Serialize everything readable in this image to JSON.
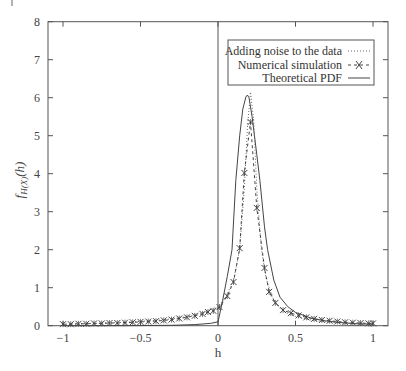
{
  "chart_data": {
    "type": "line",
    "title": "",
    "xlabel": "h",
    "ylabel": "f_{H(X)}(h)",
    "xlim": [
      -1,
      1
    ],
    "ylim": [
      0,
      8
    ],
    "grid": false,
    "legend_position": "upper right",
    "x_ticks": [
      "-1",
      "-0.5",
      "0",
      "0.5",
      "1"
    ],
    "y_ticks": [
      "0",
      "1",
      "2",
      "3",
      "4",
      "5",
      "6",
      "7",
      "8"
    ],
    "annotations": [
      "vertical line at h = 0"
    ],
    "series": [
      {
        "name": "Adding noise to the data",
        "style": "dotted",
        "x": [
          -1,
          -0.8,
          -0.6,
          -0.4,
          -0.3,
          -0.2,
          -0.1,
          0,
          0.05,
          0.1,
          0.14,
          0.17,
          0.19,
          0.21,
          0.23,
          0.25,
          0.28,
          0.31,
          0.35,
          0.4,
          0.45,
          0.5,
          0.6,
          0.7,
          0.8,
          0.9,
          1
        ],
        "y": [
          0.04,
          0.06,
          0.09,
          0.14,
          0.18,
          0.24,
          0.34,
          0.5,
          0.75,
          1.2,
          2.0,
          3.6,
          5.2,
          6.15,
          5.4,
          3.6,
          2.0,
          1.25,
          0.75,
          0.45,
          0.32,
          0.24,
          0.15,
          0.1,
          0.07,
          0.05,
          0.04
        ]
      },
      {
        "name": "Numerical simulation",
        "style": "dash-dot with x markers",
        "x": [
          -1,
          -0.95,
          -0.9,
          -0.85,
          -0.8,
          -0.75,
          -0.7,
          -0.65,
          -0.6,
          -0.55,
          -0.5,
          -0.45,
          -0.4,
          -0.35,
          -0.3,
          -0.25,
          -0.2,
          -0.15,
          -0.1,
          -0.065,
          -0.03,
          0.01,
          0.06,
          0.1,
          0.14,
          0.17,
          0.21,
          0.25,
          0.3,
          0.33,
          0.37,
          0.42,
          0.47,
          0.52,
          0.57,
          0.62,
          0.67,
          0.72,
          0.77,
          0.82,
          0.87,
          0.92,
          0.97,
          1
        ],
        "y": [
          0.04,
          0.04,
          0.05,
          0.05,
          0.06,
          0.06,
          0.07,
          0.07,
          0.08,
          0.09,
          0.1,
          0.11,
          0.12,
          0.14,
          0.16,
          0.19,
          0.22,
          0.26,
          0.31,
          0.36,
          0.39,
          0.49,
          0.78,
          1.15,
          2.04,
          4.02,
          5.36,
          3.1,
          1.52,
          0.89,
          0.6,
          0.41,
          0.33,
          0.27,
          0.22,
          0.18,
          0.15,
          0.13,
          0.11,
          0.09,
          0.08,
          0.07,
          0.06,
          0.06
        ]
      },
      {
        "name": "Theoretical PDF",
        "style": "solid",
        "x": [
          -1,
          -0.6,
          -0.3,
          -0.15,
          -0.05,
          0,
          0.03,
          0.06,
          0.09,
          0.115,
          0.14,
          0.16,
          0.18,
          0.19,
          0.2,
          0.22,
          0.25,
          0.27,
          0.3,
          0.32,
          0.36,
          0.4,
          0.45,
          0.5,
          0.6,
          0.7,
          0.8,
          0.9,
          1
        ],
        "y": [
          0.0,
          0.0,
          0.01,
          0.03,
          0.06,
          0.1,
          0.67,
          1.3,
          2.0,
          3.82,
          5.0,
          5.7,
          6.02,
          6.07,
          6.0,
          5.5,
          4.5,
          3.82,
          2.6,
          2.0,
          1.2,
          0.75,
          0.5,
          0.35,
          0.2,
          0.12,
          0.08,
          0.05,
          0.04
        ]
      }
    ]
  },
  "legend": {
    "items": [
      {
        "label": "Adding noise to the data",
        "style": "dotted"
      },
      {
        "label": "Numerical simulation",
        "style": "dash-x"
      },
      {
        "label": "Theoretical PDF",
        "style": "solid"
      }
    ]
  },
  "axes": {
    "xlabel": "h",
    "ylabel_main": "f",
    "ylabel_sub": "H(X)",
    "ylabel_arg": "(h)"
  },
  "colors": {
    "line": "#444444",
    "frame": "#555555"
  }
}
